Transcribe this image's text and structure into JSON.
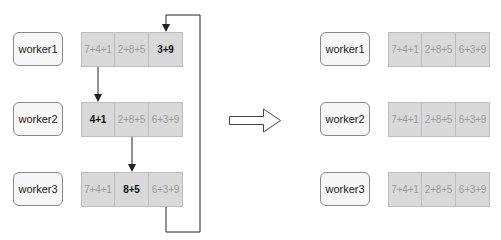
{
  "diagram": {
    "before": {
      "workers": [
        {
          "label": "worker1",
          "cells": [
            "7+4+1",
            "2+8+5",
            "3+9"
          ],
          "active_index": 2
        },
        {
          "label": "worker2",
          "cells": [
            "4+1",
            "2+8+5",
            "6+3+9"
          ],
          "active_index": 0
        },
        {
          "label": "worker3",
          "cells": [
            "7+4+1",
            "8+5",
            "6+3+9"
          ],
          "active_index": 1
        }
      ],
      "arrows": [
        {
          "from": "worker1.cell0",
          "to": "worker2.cell0"
        },
        {
          "from": "worker2.cell1",
          "to": "worker3.cell1"
        },
        {
          "from": "worker3.cell2",
          "to": "worker1.cell2",
          "routing": "loop-right"
        }
      ]
    },
    "transition_arrow": "block-arrow-right",
    "after": {
      "workers": [
        {
          "label": "worker1",
          "cells": [
            "7+4+1",
            "2+8+5",
            "6+3+9"
          ]
        },
        {
          "label": "worker2",
          "cells": [
            "7+4+1",
            "2+8+5",
            "6+3+9"
          ]
        },
        {
          "label": "worker3",
          "cells": [
            "7+4+1",
            "2+8+5",
            "6+3+9"
          ]
        }
      ]
    },
    "colors": {
      "cell_fill": "#d9d9d9",
      "worker_fill": "#f7f7f7",
      "muted_text": "#9a9a9a",
      "active_text": "#111111",
      "arrow": "#222222"
    }
  }
}
